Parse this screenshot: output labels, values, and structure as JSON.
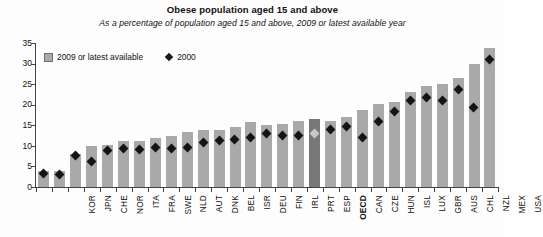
{
  "chart_data": {
    "type": "bar",
    "title": "Obese population aged 15 and above",
    "subtitle": "As a percentage of population aged 15 and above, 2009 or latest available year",
    "xlabel": "",
    "ylabel": "",
    "ylim": [
      0,
      35
    ],
    "yticks": [
      0,
      5,
      10,
      15,
      20,
      25,
      30,
      35
    ],
    "grid": false,
    "legend_position": "top-left",
    "highlight_category": "OECD",
    "categories": [
      "KOR",
      "JPN",
      "CHE",
      "NOR",
      "ITA",
      "FRA",
      "SWE",
      "NLD",
      "AUT",
      "DNK",
      "BEL",
      "ISR",
      "DEU",
      "FIN",
      "IRL",
      "PRT",
      "ESP",
      "OECD",
      "CAN",
      "CZE",
      "HUN",
      "ISL",
      "LUX",
      "GBR",
      "AUS",
      "CHL",
      "NZL",
      "MEX",
      "USA"
    ],
    "series": [
      {
        "name": "2009 or latest available",
        "type": "bar",
        "color": "#a9a9a9",
        "values": [
          4.0,
          3.9,
          8.1,
          10.0,
          10.3,
          11.2,
          11.2,
          11.8,
          12.4,
          13.4,
          13.8,
          13.8,
          14.7,
          15.7,
          15.0,
          15.3,
          16.0,
          16.6,
          16.1,
          17.0,
          18.8,
          20.1,
          20.6,
          23.0,
          24.6,
          25.1,
          26.5,
          30.0,
          33.8
        ]
      },
      {
        "name": "2000",
        "type": "scatter-diamond",
        "color": "#141414",
        "values": [
          3.2,
          3.1,
          7.7,
          6.1,
          8.8,
          9.4,
          9.2,
          9.5,
          9.3,
          9.5,
          10.8,
          11.3,
          11.5,
          12.0,
          13.0,
          12.6,
          12.6,
          12.9,
          14.1,
          14.8,
          12.0,
          16.0,
          18.4,
          21.0,
          21.7,
          21.0,
          23.8,
          19.4,
          30.9
        ]
      }
    ]
  },
  "legend": {
    "items": [
      {
        "label": "2009 or latest available",
        "marker": "square-gray"
      },
      {
        "label": "2000",
        "marker": "diamond-black"
      }
    ]
  }
}
